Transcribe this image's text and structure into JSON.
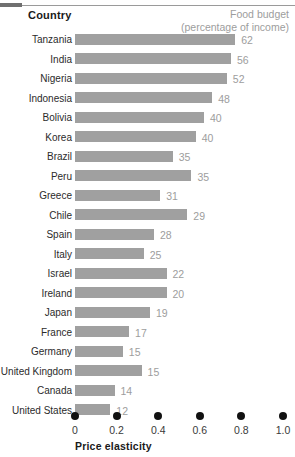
{
  "header": {
    "country_label": "Country",
    "food_budget_line1": "Food budget",
    "food_budget_line2": "(percentage of income)"
  },
  "colors": {
    "bar": "#a0a0a0",
    "value_label": "#9d9d9d",
    "header_gray": "#9d9d9d",
    "text": "#231f20",
    "dot": "#111111",
    "rule": "#9a9a9a"
  },
  "chart_data": {
    "type": "bar",
    "title": "",
    "xlabel": "Price elasticity",
    "ylabel": "Country",
    "orientation": "horizontal",
    "xlim": [
      0,
      1.0
    ],
    "xticks": [
      0,
      0.2,
      0.4,
      0.6,
      0.8,
      1.0
    ],
    "xtick_labels": [
      "0",
      "0.2",
      "0.4",
      "0.6",
      "0.8",
      "1.0"
    ],
    "grid": false,
    "legend": "none",
    "value_label_note": "Numbers at the end of each bar are the food budget as a percentage of income; the bar length encodes price elasticity.",
    "categories": [
      "Tanzania",
      "India",
      "Nigeria",
      "Indonesia",
      "Bolivia",
      "Korea",
      "Brazil",
      "Peru",
      "Greece",
      "Chile",
      "Spain",
      "Italy",
      "Israel",
      "Ireland",
      "Japan",
      "France",
      "Germany",
      "United Kingdom",
      "Canada",
      "United States"
    ],
    "series": [
      {
        "name": "Price elasticity",
        "values": [
          0.77,
          0.75,
          0.73,
          0.66,
          0.62,
          0.58,
          0.47,
          0.56,
          0.41,
          0.54,
          0.38,
          0.33,
          0.44,
          0.44,
          0.36,
          0.26,
          0.23,
          0.32,
          0.19,
          0.17
        ]
      },
      {
        "name": "Food budget (percentage of income)",
        "values": [
          62,
          56,
          52,
          48,
          40,
          40,
          35,
          35,
          31,
          29,
          28,
          25,
          22,
          20,
          19,
          17,
          15,
          15,
          14,
          12
        ]
      }
    ]
  }
}
